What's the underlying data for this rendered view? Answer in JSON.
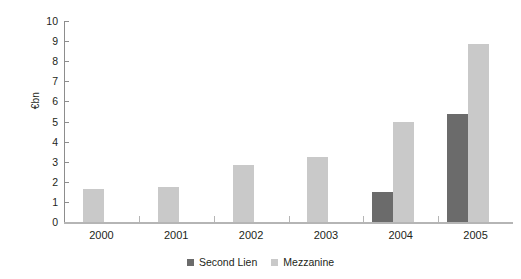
{
  "chart_data": {
    "type": "bar",
    "title": "",
    "subtitle": "",
    "xlabel": "",
    "ylabel": "€bn",
    "categories": [
      "2000",
      "2001",
      "2002",
      "2003",
      "2004",
      "2005"
    ],
    "series": [
      {
        "name": "Second Lien",
        "color": "#6b6b6b",
        "values": [
          null,
          null,
          null,
          null,
          1.5,
          5.35
        ]
      },
      {
        "name": "Mezzanine",
        "color": "#c9c9c9",
        "values": [
          1.65,
          1.75,
          2.85,
          3.25,
          5.0,
          8.85
        ]
      }
    ],
    "ylim": [
      0,
      10
    ],
    "y_ticks": [
      "0",
      "1",
      "2",
      "3",
      "4",
      "5",
      "6",
      "7",
      "8",
      "9",
      "10"
    ],
    "grid": false,
    "legend_position": "bottom-center"
  },
  "legend": {
    "items": [
      {
        "label": "Second Lien",
        "color": "#6b6b6b"
      },
      {
        "label": "Mezzanine",
        "color": "#c9c9c9"
      }
    ]
  },
  "axis": {
    "y_title": "€bn",
    "axis_color": "#8d8d8d",
    "baseline_color": "#b5b5b5"
  }
}
